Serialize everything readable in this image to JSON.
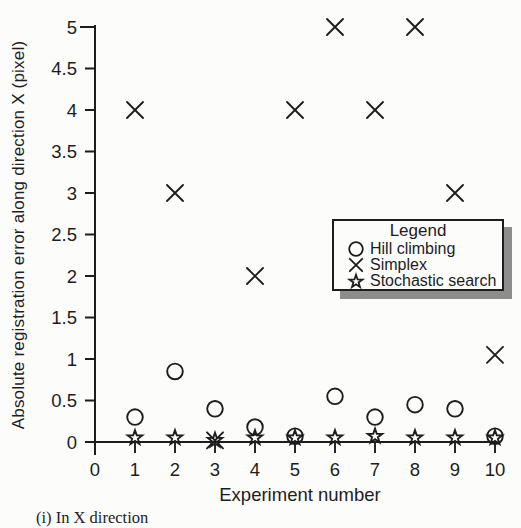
{
  "figure": {
    "caption": "(i) In X direction"
  },
  "colors": {
    "ink": "#1d1d1d",
    "paper": "#fcfcfb",
    "legend_shadow": "#8d8d8d"
  },
  "chart_data": {
    "type": "scatter",
    "title": "",
    "xlabel": "Experiment number",
    "ylabel": "Absolute registration error along direction X (pixel)",
    "xlim": [
      0,
      10
    ],
    "ylim": [
      0,
      5
    ],
    "xticks": [
      0,
      1,
      2,
      3,
      4,
      5,
      6,
      7,
      8,
      9,
      10
    ],
    "yticks": [
      0,
      0.5,
      1,
      1.5,
      2,
      2.5,
      3,
      3.5,
      4,
      4.5,
      5
    ],
    "grid": false,
    "x": [
      1,
      2,
      3,
      4,
      5,
      6,
      7,
      8,
      9,
      10
    ],
    "series": [
      {
        "name": "Hill climbing",
        "marker": "circle",
        "values": [
          0.3,
          0.85,
          0.4,
          0.18,
          0.07,
          0.55,
          0.3,
          0.45,
          0.4,
          0.07
        ]
      },
      {
        "name": "Simplex",
        "marker": "x",
        "values": [
          4,
          3,
          0.02,
          2,
          4,
          5,
          4,
          5,
          3,
          1.05
        ]
      },
      {
        "name": "Stochastic search",
        "marker": "star",
        "values": [
          0.05,
          0.05,
          0.02,
          0.05,
          0.05,
          0.05,
          0.07,
          0.05,
          0.05,
          0.05
        ]
      }
    ],
    "legend": {
      "title": "Legend",
      "position": "middle-right",
      "items": [
        {
          "marker": "circle",
          "label": "Hill climbing"
        },
        {
          "marker": "x",
          "label": "Simplex"
        },
        {
          "marker": "star",
          "label": "Stochastic search"
        }
      ]
    }
  }
}
